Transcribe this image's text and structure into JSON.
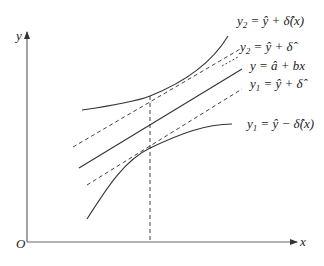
{
  "diagram": {
    "type": "confidence-band-regression",
    "axes": {
      "x_label": "x",
      "y_label": "y",
      "origin_label": "O"
    },
    "curves": [
      {
        "id": "upper-curve",
        "style": "solid",
        "label_main": "y",
        "label_sub": "2",
        "label_rest": " = ŷ + δ̂(x)"
      },
      {
        "id": "upper-dashed",
        "style": "dashed",
        "label_main": "y",
        "label_sub": "2",
        "label_rest": " = ŷ + δ̂"
      },
      {
        "id": "regression-line",
        "style": "solid",
        "label_main": "y",
        "label_sub": "",
        "label_rest": " = â + bx"
      },
      {
        "id": "lower-dashed",
        "style": "dashed",
        "label_main": "y",
        "label_sub": "1",
        "label_rest": " = ŷ + δ̂"
      },
      {
        "id": "lower-curve",
        "style": "solid",
        "label_main": "y",
        "label_sub": "1",
        "label_rest": " = ŷ − δ̂(x)"
      }
    ],
    "colors": {
      "line": "#333333",
      "axis": "#555555"
    }
  }
}
